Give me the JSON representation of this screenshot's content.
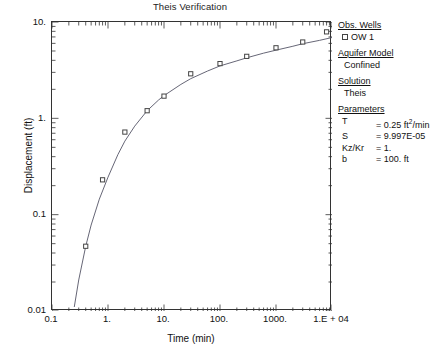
{
  "chart_data": {
    "type": "line",
    "title": "Theis Verification",
    "xlabel": "Time (min)",
    "ylabel": "Displacement (ft)",
    "xscale": "log",
    "yscale": "log",
    "xlim": [
      0.1,
      10000
    ],
    "ylim": [
      0.01,
      10
    ],
    "grid": false,
    "xtick_labels": [
      "0.1",
      "1.",
      "10.",
      "100.",
      "1000.",
      "1.E + 04"
    ],
    "xtick_values": [
      0.1,
      1,
      10,
      100,
      1000,
      10000
    ],
    "ytick_labels": [
      "0.01",
      "0.1",
      "1.",
      "10."
    ],
    "ytick_values": [
      0.01,
      0.1,
      1,
      10
    ],
    "legend_position": "right-outside",
    "series": [
      {
        "name": "OW 1",
        "kind": "observed",
        "marker": "open-square",
        "x": [
          0.4,
          0.8,
          2.0,
          5.0,
          10.0,
          30.0,
          100.0,
          300.0,
          1000.0,
          3000.0,
          8000.0
        ],
        "y": [
          0.047,
          0.23,
          0.72,
          1.2,
          1.7,
          2.9,
          3.7,
          4.4,
          5.4,
          6.2,
          7.9
        ]
      },
      {
        "name": "Theis type curve",
        "kind": "model",
        "marker": "none",
        "x": [
          0.25,
          0.3,
          0.4,
          0.5,
          0.7,
          1.0,
          1.5,
          2.0,
          3.0,
          5.0,
          8.0,
          10.0,
          20.0,
          30.0,
          60.0,
          100.0,
          200.0,
          300.0,
          600.0,
          1000.0,
          2000.0,
          3000.0,
          6000.0,
          10000.0
        ],
        "y": [
          0.011,
          0.021,
          0.047,
          0.078,
          0.145,
          0.245,
          0.42,
          0.58,
          0.83,
          1.2,
          1.55,
          1.72,
          2.25,
          2.58,
          3.1,
          3.5,
          3.95,
          4.25,
          4.75,
          5.1,
          5.6,
          5.95,
          6.45,
          6.9
        ]
      }
    ]
  },
  "legend": {
    "obs_wells": {
      "header": "Obs. Wells",
      "items": [
        "OW 1"
      ]
    },
    "aquifer_model": {
      "header": "Aquifer Model",
      "value": "Confined"
    },
    "solution": {
      "header": "Solution",
      "value": "Theis"
    },
    "parameters": {
      "header": "Parameters",
      "rows": [
        {
          "name": "T",
          "value": "= 0.25 ft²/min",
          "value_base": "= 0.25 ft",
          "value_sup": "2",
          "value_tail": "/min"
        },
        {
          "name": "S",
          "value": "= 9.997E-05",
          "value_base": "= 9.997E-05",
          "value_sup": "",
          "value_tail": ""
        },
        {
          "name": "Kz/Kr",
          "value": "= 1.",
          "value_base": "= 1.",
          "value_sup": "",
          "value_tail": ""
        },
        {
          "name": "b",
          "value": "= 100. ft",
          "value_base": "= 100. ft",
          "value_sup": "",
          "value_tail": ""
        }
      ]
    }
  },
  "colors": {
    "axis": "#333333",
    "curve": "#555566",
    "marker_edge": "#444444",
    "text": "#111111",
    "background": "#ffffff"
  }
}
